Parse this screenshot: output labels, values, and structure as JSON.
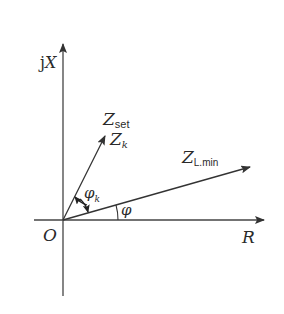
{
  "diagram": {
    "type": "impedance-plane-phasor",
    "axes": {
      "vertical": {
        "label_prefix": "j",
        "label_var": "X"
      },
      "horizontal": {
        "label": "R"
      },
      "origin_label": "O"
    },
    "vectors": [
      {
        "id": "z-set-zk",
        "label_main": "Z",
        "label_sub": "set",
        "label2_main": "Z",
        "label2_sub": "k"
      },
      {
        "id": "z-l-min",
        "label_main": "Z",
        "label_sub": "L.min"
      }
    ],
    "angles": [
      {
        "id": "phi-k",
        "symbol": "φ",
        "sub": "k"
      },
      {
        "id": "phi",
        "symbol": "φ"
      }
    ],
    "colors": {
      "stroke": "#333333",
      "background": "#ffffff"
    }
  }
}
